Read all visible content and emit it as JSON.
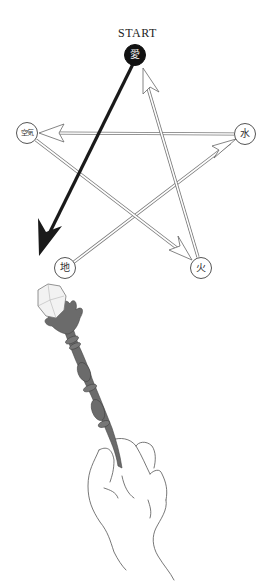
{
  "diagram": {
    "start_label": "START",
    "nodes": [
      {
        "id": "love",
        "label": "愛",
        "x": 135,
        "y": 55,
        "style": "dark"
      },
      {
        "id": "air",
        "label": "空気",
        "x": 27,
        "y": 133,
        "style": "light"
      },
      {
        "id": "water",
        "label": "水",
        "x": 245,
        "y": 134,
        "style": "light"
      },
      {
        "id": "earth",
        "label": "地",
        "x": 65,
        "y": 268,
        "style": "light"
      },
      {
        "id": "fire",
        "label": "火",
        "x": 201,
        "y": 268,
        "style": "light"
      }
    ],
    "edges": [
      {
        "from": "love",
        "to": "earth",
        "style": "bold-arrow"
      },
      {
        "from": "earth",
        "to": "water",
        "style": "outline-arrow"
      },
      {
        "from": "water",
        "to": "air",
        "style": "outline-arrow"
      },
      {
        "from": "air",
        "to": "fire",
        "style": "outline-arrow"
      },
      {
        "from": "fire",
        "to": "love",
        "style": "outline-arrow"
      }
    ],
    "illustration": "hand holding wand with crystal tip"
  }
}
